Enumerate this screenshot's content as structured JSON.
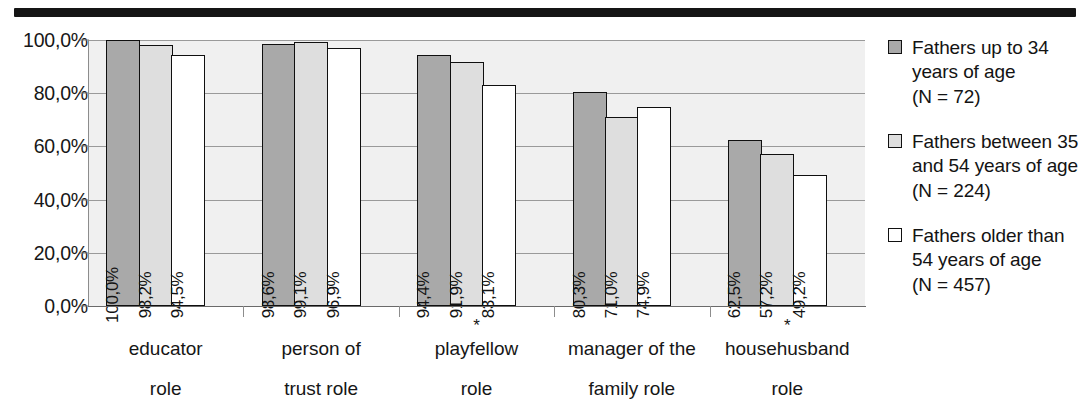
{
  "chart_data": {
    "type": "bar",
    "title": "",
    "xlabel": "",
    "ylabel": "",
    "ylim": [
      0,
      100
    ],
    "grid": true,
    "legend_position": "right",
    "categories": [
      "educator role",
      "person of trust role",
      "playfellow role",
      "manager of the family role",
      "househusband role"
    ],
    "category_lines": [
      {
        "star": "",
        "line1": "educator",
        "line2": "role"
      },
      {
        "star": "",
        "line1": "person of",
        "line2": "trust role"
      },
      {
        "star": "*",
        "line1": "playfellow",
        "line2": "role"
      },
      {
        "star": "",
        "line1": "manager of the",
        "line2": "family role"
      },
      {
        "star": "*",
        "line1": "househusband",
        "line2": "role"
      }
    ],
    "y_ticks": [
      {
        "value": 100,
        "label": "100,0%"
      },
      {
        "value": 80,
        "label": "80,0%"
      },
      {
        "value": 60,
        "label": "60,0%"
      },
      {
        "value": 40,
        "label": "40,0%"
      },
      {
        "value": 20,
        "label": "20,0%"
      },
      {
        "value": 0,
        "label": "0,0%"
      }
    ],
    "series": [
      {
        "name": "Fathers up to 34 years of age (N = 72)",
        "color": "#a9a9a9",
        "values": [
          100.0,
          98.6,
          94.4,
          80.3,
          62.5
        ],
        "labels": [
          "100,0%",
          "98,6%",
          "94,4%",
          "80,3%",
          "62,5%"
        ]
      },
      {
        "name": "Fathers between 35 and 54 years of age (N = 224)",
        "color": "#dedede",
        "values": [
          98.2,
          99.1,
          91.9,
          71.0,
          57.2
        ],
        "labels": [
          "98,2%",
          "99,1%",
          "91,9%",
          "71,0%",
          "57,2%"
        ]
      },
      {
        "name": "Fathers older than 54 years of age (N = 457)",
        "color": "#ffffff",
        "values": [
          94.5,
          96.9,
          83.1,
          74.9,
          49.2
        ],
        "labels": [
          "94,5%",
          "96,9%",
          "83,1%",
          "74,9%",
          "49,2%"
        ]
      }
    ]
  },
  "legend": {
    "items": [
      {
        "swatch": "s0",
        "text": "Fathers up to 34\nyears of age\n(N = 72)"
      },
      {
        "swatch": "s1",
        "text": "Fathers between 35\nand 54 years of age\n(N = 224)"
      },
      {
        "swatch": "s2",
        "text": "Fathers older than\n54 years of age\n(N = 457)"
      }
    ]
  }
}
